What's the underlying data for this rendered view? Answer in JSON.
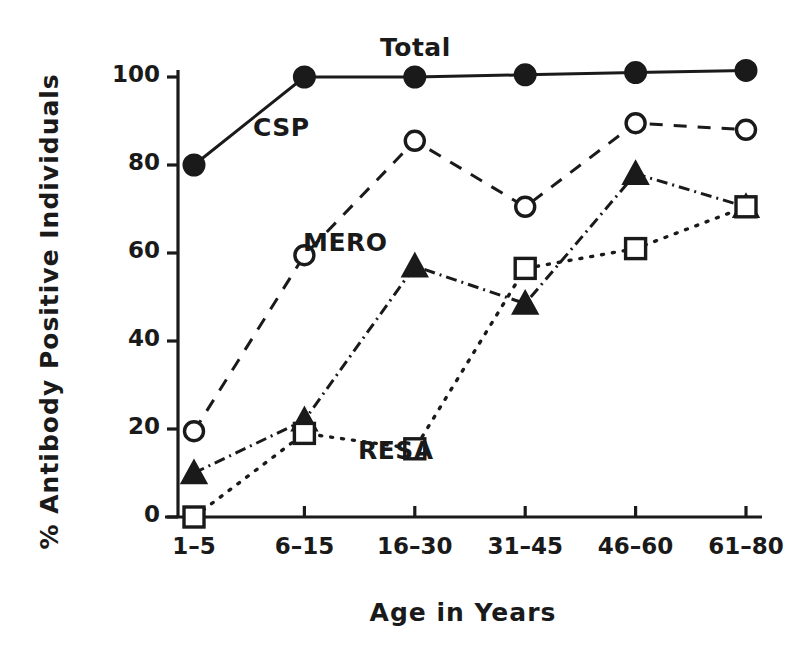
{
  "chart_data": {
    "type": "line",
    "title": "",
    "xlabel": "Age in Years",
    "ylabel": "% Antibody Positive Individuals",
    "categories": [
      "1-5",
      "6-15",
      "16-30",
      "31-45",
      "46-60",
      "61-80"
    ],
    "ylim": [
      0,
      108
    ],
    "yticks": [
      0,
      20,
      40,
      60,
      80,
      100
    ],
    "ytick_labels": [
      "0",
      "20",
      "40",
      "60",
      "80",
      "100"
    ],
    "grid": false,
    "legend": "inline-labels",
    "series": [
      {
        "name": "Total",
        "marker": "filled-circle",
        "line": "solid",
        "values": [
          80,
          100,
          100,
          100.5,
          101,
          101.5
        ]
      },
      {
        "name": "CSP",
        "marker": "open-circle",
        "line": "dashed",
        "values": [
          19.5,
          59.5,
          85.5,
          70.5,
          89.5,
          88
        ]
      },
      {
        "name": "MERO",
        "marker": "filled-triangle",
        "line": "dash-dot",
        "values": [
          10,
          22,
          57,
          48.5,
          78,
          70.5
        ]
      },
      {
        "name": "RESA",
        "marker": "open-square",
        "line": "dotted",
        "values": [
          0,
          19,
          15.5,
          56.5,
          61,
          70.5
        ]
      }
    ],
    "series_label_positions": [
      {
        "name": "Total",
        "x": 380,
        "y": 33
      },
      {
        "name": "CSP",
        "x": 253,
        "y": 113
      },
      {
        "name": "MERO",
        "x": 303,
        "y": 228
      },
      {
        "name": "RESA",
        "x": 358,
        "y": 436
      }
    ],
    "colors": {
      "axis": "#1a1a1a",
      "series": "#1a1a1a",
      "background": "#ffffff"
    }
  }
}
